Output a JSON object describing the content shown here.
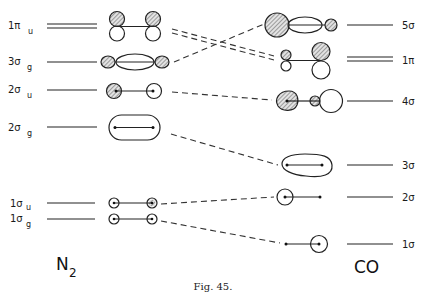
{
  "diagram": {
    "type": "molecular-orbital-correlation",
    "caption": "Fig. 45.",
    "left_molecule": {
      "label": "N",
      "subscript": "2"
    },
    "right_molecule": {
      "label": "CO"
    },
    "left_levels": [
      {
        "id": "1pi_u",
        "symbol": "1π",
        "subscript": "u",
        "degenerate": true
      },
      {
        "id": "3sigma_g",
        "symbol": "3σ",
        "subscript": "g",
        "degenerate": false
      },
      {
        "id": "2sigma_u",
        "symbol": "2σ",
        "subscript": "u",
        "degenerate": false
      },
      {
        "id": "2sigma_g",
        "symbol": "2σ",
        "subscript": "g",
        "degenerate": false
      },
      {
        "id": "1sigma_u",
        "symbol": "1σ",
        "subscript": "u",
        "degenerate": false
      },
      {
        "id": "1sigma_g",
        "symbol": "1σ",
        "subscript": "g",
        "degenerate": false
      }
    ],
    "right_levels": [
      {
        "id": "5sigma",
        "symbol": "5σ",
        "degenerate": false
      },
      {
        "id": "1pi",
        "symbol": "1π",
        "degenerate": true
      },
      {
        "id": "4sigma",
        "symbol": "4σ",
        "degenerate": false
      },
      {
        "id": "3sigma",
        "symbol": "3σ",
        "degenerate": false
      },
      {
        "id": "2sigma",
        "symbol": "2σ",
        "degenerate": false
      },
      {
        "id": "1sigma",
        "symbol": "1σ",
        "degenerate": false
      }
    ],
    "correlations": [
      {
        "from": "1π_u",
        "to": "1π"
      },
      {
        "from": "3σ_g",
        "to": "5σ"
      },
      {
        "from": "2σ_u",
        "to": "4σ"
      },
      {
        "from": "2σ_g",
        "to": "3σ"
      },
      {
        "from": "1σ_u",
        "to": "2σ"
      },
      {
        "from": "1σ_g",
        "to": "1σ"
      }
    ]
  }
}
